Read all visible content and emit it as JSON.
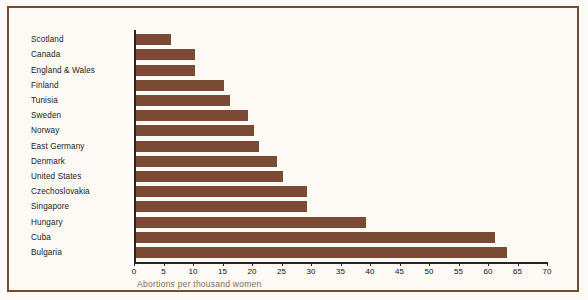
{
  "chart_data": {
    "type": "bar",
    "orientation": "horizontal",
    "title": "",
    "xlabel": "Abortions per thousand women",
    "ylabel": "",
    "xlim": [
      0,
      70
    ],
    "xticks": [
      0,
      5,
      10,
      15,
      20,
      25,
      30,
      35,
      40,
      45,
      50,
      55,
      60,
      65,
      70
    ],
    "grid": false,
    "legend": null,
    "categories": [
      "Scotland",
      "Canada",
      "England & Wales",
      "Finland",
      "Tunisia",
      "Sweden",
      "Norway",
      "East Germany",
      "Denmark",
      "United States",
      "Czechoslovakia",
      "Singapore",
      "Hungary",
      "Cuba",
      "Bulgaria"
    ],
    "values": [
      6,
      10,
      10,
      15,
      16,
      19,
      20,
      21,
      24,
      25,
      29,
      29,
      39,
      61,
      63
    ],
    "bar_color": "#7a4a34",
    "axis_color": "#2a2320",
    "frame_color": "#7b4a33",
    "background_color": "#fdfaf6",
    "xlabel_color": "#8a6a58"
  }
}
